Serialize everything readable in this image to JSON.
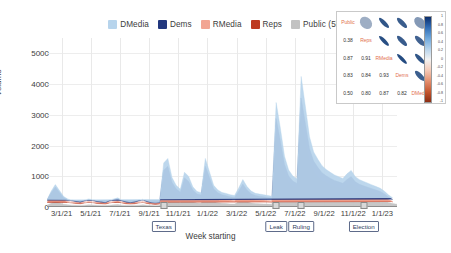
{
  "chart_data": {
    "type": "area",
    "title": "",
    "xlabel": "Week starting",
    "ylabel": "Volume",
    "ylim": [
      0,
      5500
    ],
    "yticks": [
      0,
      1000,
      2000,
      3000,
      4000,
      5000
    ],
    "ytick_labels": [
      "0",
      "1000",
      "2000",
      "3000",
      "4000",
      "5000"
    ],
    "grid": true,
    "legend_position": "top-center",
    "stacked": true,
    "xtick_labels": [
      "3/1/21",
      "5/1/21",
      "7/1/21",
      "9/1/21",
      "11/1/21",
      "1/1/22",
      "3/1/22",
      "5/1/22",
      "7/1/22",
      "9/1/22",
      "11/1/22",
      "1/1/23"
    ],
    "legend": [
      {
        "label": "DMedia",
        "color": "#b7d4ec"
      },
      {
        "label": "Dems",
        "color": "#22377e"
      },
      {
        "label": "RMedia",
        "color": "#f2a593"
      },
      {
        "label": "Reps",
        "color": "#bd3a21"
      },
      {
        "label": "Public (5k)",
        "color": "#c2c2c2"
      }
    ],
    "series": [
      {
        "name": "Public (5k)",
        "color": "#c2c2c2",
        "values": [
          60,
          120,
          180,
          140,
          90,
          70,
          60,
          55,
          50,
          60,
          70,
          65,
          55,
          50,
          45,
          60,
          70,
          80,
          60,
          50,
          45,
          50,
          60,
          70,
          55,
          45,
          40,
          45,
          380,
          420,
          250,
          180,
          150,
          300,
          260,
          170,
          130,
          120,
          420,
          300,
          180,
          140,
          120,
          110,
          100,
          95,
          160,
          230,
          170,
          130,
          110,
          105,
          100,
          95,
          90,
          1500,
          1100,
          700,
          500,
          420,
          380,
          1700,
          1300,
          900,
          700,
          600,
          520,
          470,
          430,
          400,
          380,
          360,
          420,
          460,
          380,
          340,
          320,
          300,
          280,
          260,
          240,
          200,
          150,
          110,
          90
        ]
      },
      {
        "name": "Reps",
        "color": "#bd3a21",
        "values": [
          80,
          180,
          240,
          170,
          110,
          80,
          70,
          60,
          55,
          70,
          85,
          75,
          60,
          55,
          50,
          70,
          85,
          95,
          70,
          55,
          50,
          55,
          70,
          80,
          60,
          50,
          45,
          50,
          300,
          330,
          200,
          150,
          120,
          240,
          210,
          140,
          110,
          100,
          330,
          240,
          150,
          120,
          100,
          95,
          85,
          80,
          130,
          190,
          140,
          110,
          95,
          90,
          85,
          80,
          75,
          520,
          400,
          260,
          190,
          160,
          145,
          700,
          540,
          380,
          300,
          260,
          225,
          205,
          190,
          175,
          165,
          155,
          180,
          200,
          165,
          150,
          140,
          130,
          120,
          110,
          100,
          85,
          65,
          50
        ]
      },
      {
        "name": "RMedia",
        "color": "#f2a593",
        "values": [
          30,
          70,
          100,
          70,
          45,
          35,
          30,
          25,
          22,
          28,
          34,
          30,
          25,
          22,
          20,
          28,
          34,
          38,
          28,
          22,
          20,
          22,
          28,
          32,
          24,
          20,
          18,
          20,
          140,
          155,
          95,
          70,
          58,
          110,
          98,
          65,
          50,
          46,
          155,
          112,
          70,
          56,
          47,
          44,
          40,
          38,
          60,
          88,
          66,
          52,
          45,
          42,
          40,
          38,
          35,
          240,
          185,
          120,
          88,
          74,
          67,
          320,
          250,
          175,
          138,
          120,
          104,
          95,
          88,
          81,
          76,
          72,
          83,
          92,
          76,
          69,
          64,
          60,
          55,
          51,
          46,
          39,
          30,
          23
        ]
      },
      {
        "name": "Dems",
        "color": "#22377e",
        "values": [
          40,
          90,
          130,
          95,
          60,
          45,
          40,
          33,
          30,
          38,
          46,
          40,
          33,
          30,
          27,
          38,
          46,
          52,
          38,
          30,
          27,
          30,
          38,
          44,
          33,
          27,
          24,
          27,
          380,
          420,
          260,
          190,
          155,
          300,
          265,
          175,
          135,
          125,
          420,
          305,
          190,
          150,
          128,
          120,
          108,
          100,
          165,
          240,
          180,
          140,
          122,
          114,
          108,
          100,
          95,
          620,
          480,
          310,
          230,
          192,
          174,
          830,
          645,
          450,
          355,
          310,
          268,
          245,
          228,
          210,
          197,
          186,
          215,
          238,
          197,
          179,
          166,
          155,
          143,
          132,
          120,
          101,
          78,
          60
        ]
      },
      {
        "name": "DMedia",
        "color": "#b7d4ec",
        "values": [
          25,
          55,
          80,
          58,
          37,
          28,
          25,
          20,
          18,
          23,
          28,
          25,
          20,
          18,
          16,
          23,
          28,
          32,
          23,
          18,
          16,
          18,
          23,
          27,
          20,
          16,
          15,
          16,
          230,
          255,
          158,
          115,
          94,
          182,
          161,
          106,
          82,
          76,
          255,
          185,
          115,
          91,
          78,
          73,
          66,
          61,
          100,
          146,
          109,
          85,
          74,
          69,
          66,
          61,
          58,
          520,
          405,
          261,
          194,
          162,
          147,
          700,
          545,
          380,
          300,
          262,
          226,
          207,
          192,
          177,
          166,
          157,
          181,
          201,
          166,
          151,
          140,
          131,
          121,
          111,
          101,
          85,
          66,
          50
        ]
      }
    ],
    "annotations": [
      {
        "label": "Texas",
        "x_index": 28
      },
      {
        "label": "Leak",
        "x_index": 55
      },
      {
        "label": "Ruling",
        "x_index": 61
      },
      {
        "label": "Election",
        "x_index": 76
      }
    ]
  },
  "inset": {
    "type": "correlation-matrix",
    "variables": [
      "Public",
      "Reps",
      "RMedia",
      "Dems",
      "DMedia"
    ],
    "values": [
      [
        "",
        "0.38",
        "0.87",
        "0.83",
        "0.50"
      ],
      [
        "",
        "",
        "0.91",
        "0.84",
        "0.80"
      ],
      [
        "",
        "",
        "",
        "0.93",
        "0.87"
      ],
      [
        "",
        "",
        "",
        "",
        "0.82"
      ],
      [
        "",
        "",
        "",
        "",
        ""
      ]
    ],
    "colorbar_ticks": [
      "1",
      "0.8",
      "0.6",
      "0.4",
      "0.2",
      "0",
      "-0.2",
      "-0.4",
      "-0.6",
      "-0.8",
      "-1"
    ]
  }
}
